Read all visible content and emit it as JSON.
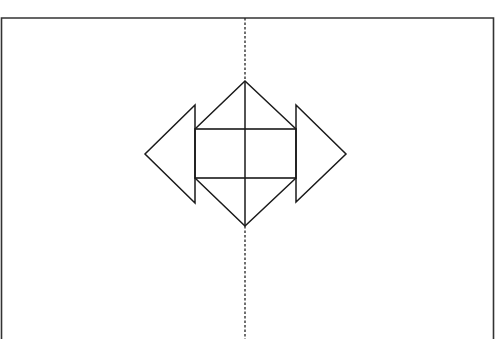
{
  "diagram": {
    "type": "geometric-figure",
    "colors": {
      "stroke": "#1a1a1a",
      "frame": "#333333",
      "axis": "#222222",
      "background": "#ffffff"
    },
    "frame": {
      "left": 1.5,
      "right": 493.5,
      "top": 18,
      "bottom": 339
    },
    "axis": {
      "x": 245,
      "y1": 18,
      "y2": 339,
      "style": "dashed"
    },
    "rectangle": {
      "x": 195,
      "y": 129,
      "width": 101,
      "height": 49
    },
    "center_lines": {
      "vertical_x": 245,
      "horizontal_y": null
    },
    "shapes": [
      {
        "name": "top-triangle",
        "points": "195,129 245,81 296,129"
      },
      {
        "name": "bottom-triangle",
        "points": "195,178 245,226 296,178"
      },
      {
        "name": "left-triangle",
        "points": "195,105 145,154 195,203"
      },
      {
        "name": "right-triangle",
        "points": "296,105 346,154 296,202"
      }
    ]
  }
}
